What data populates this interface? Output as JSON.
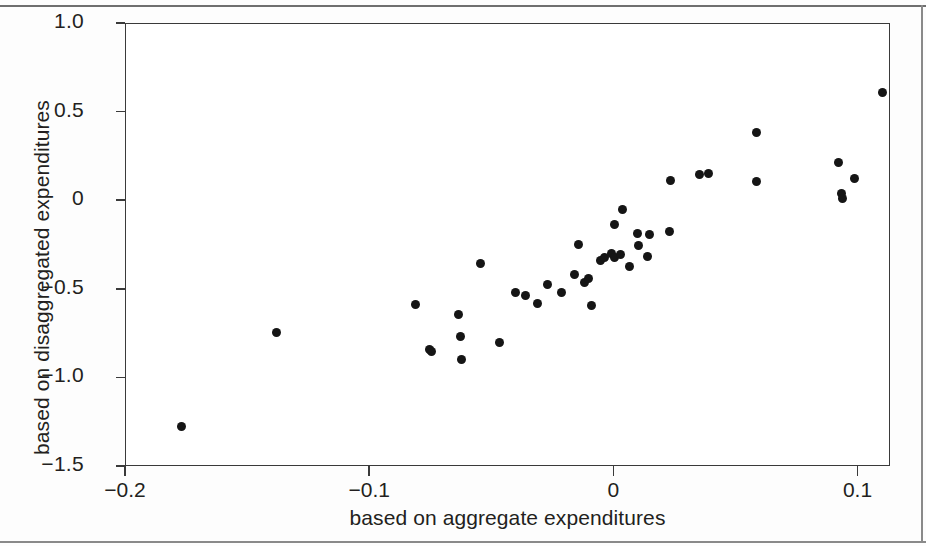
{
  "chart_data": {
    "type": "scatter",
    "title": "",
    "xlabel": "based on aggregate expenditures",
    "ylabel": "based on disaggregated expenditures",
    "xlim": [
      -0.2,
      0.1133
    ],
    "ylim": [
      -1.5,
      1.0
    ],
    "xticks": [
      -0.2,
      -0.1,
      0,
      0.1
    ],
    "xticklabels": [
      "−0.2",
      "−0.1",
      "0",
      "0.1"
    ],
    "yticks": [
      1.0,
      0.5,
      0,
      -0.5,
      -1.0,
      -1.5
    ],
    "yticklabels": [
      "1.0",
      "0.5",
      "0",
      "−0.5",
      "−1.0",
      "−1.5"
    ],
    "grid": false,
    "legend": null,
    "marker": "filled-circle",
    "marker_color": "#151515",
    "points": [
      [
        -0.1767,
        -1.279
      ],
      [
        -0.138,
        -0.747
      ],
      [
        -0.0812,
        -0.588
      ],
      [
        -0.0751,
        -0.843
      ],
      [
        -0.0743,
        -0.855
      ],
      [
        -0.0633,
        -0.646
      ],
      [
        -0.0624,
        -0.769
      ],
      [
        -0.062,
        -0.898
      ],
      [
        -0.0543,
        -0.355
      ],
      [
        -0.0465,
        -0.803
      ],
      [
        -0.04,
        -0.52
      ],
      [
        -0.0359,
        -0.536
      ],
      [
        -0.031,
        -0.581
      ],
      [
        -0.0269,
        -0.475
      ],
      [
        -0.0212,
        -0.52
      ],
      [
        -0.0159,
        -0.418
      ],
      [
        -0.0143,
        -0.249
      ],
      [
        -0.0118,
        -0.463
      ],
      [
        -0.0102,
        -0.441
      ],
      [
        -0.009,
        -0.593
      ],
      [
        -0.0053,
        -0.339
      ],
      [
        -0.0037,
        -0.322
      ],
      [
        -0.0008,
        -0.299
      ],
      [
        0.0004,
        -0.322
      ],
      [
        0.0029,
        -0.305
      ],
      [
        0.0037,
        -0.054
      ],
      [
        0.0004,
        -0.135
      ],
      [
        0.0065,
        -0.372
      ],
      [
        0.0098,
        -0.186
      ],
      [
        0.0102,
        -0.254
      ],
      [
        0.0139,
        -0.316
      ],
      [
        0.0147,
        -0.192
      ],
      [
        0.0229,
        -0.175
      ],
      [
        0.0233,
        0.113
      ],
      [
        0.0351,
        0.147
      ],
      [
        0.0388,
        0.153
      ],
      [
        0.0588,
        0.384
      ],
      [
        0.0588,
        0.107
      ],
      [
        0.0922,
        0.215
      ],
      [
        0.0935,
        0.04
      ],
      [
        0.0939,
        0.012
      ],
      [
        0.0988,
        0.124
      ],
      [
        0.1102,
        0.605
      ]
    ],
    "n_points": 43
  },
  "figure": {
    "yaxis_label": "based on disaggregated expenditures",
    "xaxis_label": "based on aggregate expenditures"
  }
}
